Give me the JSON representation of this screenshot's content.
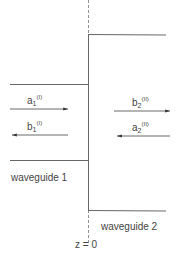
{
  "diagram": {
    "interface_label": "z = 0",
    "waveguides": [
      {
        "label": "waveguide 1"
      },
      {
        "label": "waveguide 2"
      }
    ],
    "waves": [
      {
        "base": "a",
        "sub": "1",
        "sup": "(I)",
        "direction": "right"
      },
      {
        "base": "b",
        "sub": "1",
        "sup": "(I)",
        "direction": "left"
      },
      {
        "base": "b",
        "sub": "2",
        "sup": "(II)",
        "direction": "right"
      },
      {
        "base": "a",
        "sub": "2",
        "sup": "(II)",
        "direction": "left"
      }
    ],
    "colors": {
      "line": "#666666",
      "text": "#444444"
    }
  }
}
